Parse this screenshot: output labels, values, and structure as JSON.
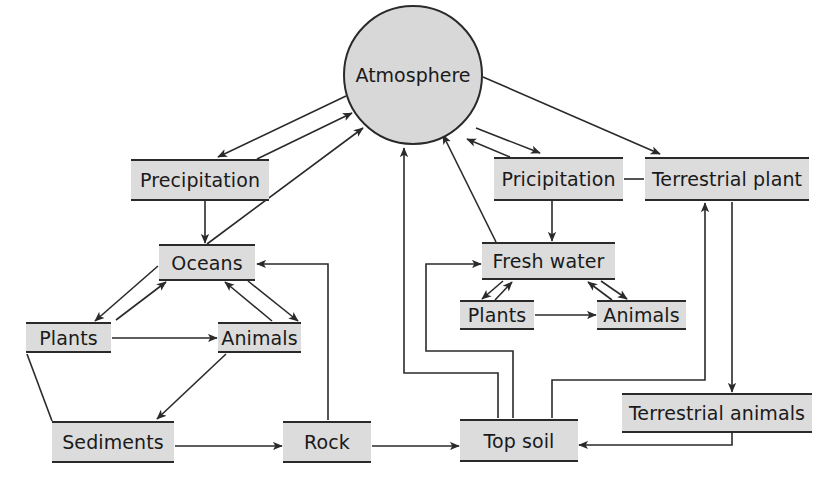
{
  "diagram": {
    "type": "cycle-flow-diagram",
    "colors": {
      "node_fill": "#dcdcdc",
      "circle_fill": "#d8d8d8",
      "line": "#2a2a2a",
      "background": "#ffffff"
    },
    "nodes": {
      "atmosphere": {
        "label": "Atmosphere",
        "shape": "circle",
        "cx": 413,
        "cy": 75,
        "r": 70
      },
      "precipitation_left": {
        "label": "Precipitation",
        "x": 131,
        "y": 159,
        "w": 138,
        "h": 42
      },
      "oceans": {
        "label": "Oceans",
        "x": 159,
        "y": 244,
        "w": 96,
        "h": 37
      },
      "plants_left": {
        "label": "Plants",
        "x": 26,
        "y": 322,
        "w": 85,
        "h": 31
      },
      "animals_left": {
        "label": "Animals",
        "x": 218,
        "y": 322,
        "w": 83,
        "h": 31
      },
      "sediments": {
        "label": "Sediments",
        "x": 52,
        "y": 421,
        "w": 122,
        "h": 42
      },
      "rock": {
        "label": "Rock",
        "x": 283,
        "y": 421,
        "w": 88,
        "h": 42
      },
      "top_soil": {
        "label": "Top soil",
        "x": 460,
        "y": 419,
        "w": 118,
        "h": 43
      },
      "precipitation_right": {
        "label": "Pricipitation",
        "x": 494,
        "y": 157,
        "w": 129,
        "h": 44
      },
      "terrestrial_plant": {
        "label": "Terrestrial plant",
        "x": 645,
        "y": 157,
        "w": 164,
        "h": 44
      },
      "fresh_water": {
        "label": "Fresh water",
        "x": 482,
        "y": 242,
        "w": 133,
        "h": 38
      },
      "plants_right": {
        "label": "Plants",
        "x": 460,
        "y": 300,
        "w": 74,
        "h": 30
      },
      "animals_right": {
        "label": "Animals",
        "x": 597,
        "y": 300,
        "w": 89,
        "h": 30
      },
      "terrestrial_animals": {
        "label": "Terrestrial animals",
        "x": 622,
        "y": 393,
        "w": 190,
        "h": 40
      }
    },
    "edges": [
      {
        "from": "atmosphere",
        "to": "precipitation_left",
        "points": [
          [
            346,
            96
          ],
          [
            218,
            157
          ]
        ],
        "arrow": "end"
      },
      {
        "from": "precipitation_left",
        "to": "atmosphere",
        "points": [
          [
            257,
            159
          ],
          [
            352,
            113
          ]
        ],
        "arrow": "end"
      },
      {
        "from": "precipitation_left",
        "to": "oceans",
        "points": [
          [
            205,
            201
          ],
          [
            205,
            243
          ]
        ],
        "arrow": "end"
      },
      {
        "from": "oceans",
        "to": "atmosphere",
        "points": [
          [
            207,
            244
          ],
          [
            363,
            128
          ]
        ],
        "arrow": "end"
      },
      {
        "from": "oceans",
        "to": "plants_left",
        "points": [
          [
            158,
            266
          ],
          [
            95,
            321
          ]
        ],
        "arrow": "end"
      },
      {
        "from": "plants_left",
        "to": "oceans",
        "points": [
          [
            116,
            320
          ],
          [
            166,
            282
          ]
        ],
        "arrow": "end"
      },
      {
        "from": "oceans",
        "to": "animals_left",
        "points": [
          [
            248,
            281
          ],
          [
            298,
            321
          ]
        ],
        "arrow": "end"
      },
      {
        "from": "animals_left",
        "to": "oceans",
        "points": [
          [
            272,
            321
          ],
          [
            225,
            282
          ]
        ],
        "arrow": "end"
      },
      {
        "from": "plants_left",
        "to": "animals_left",
        "points": [
          [
            112,
            338
          ],
          [
            217,
            338
          ]
        ],
        "arrow": "end"
      },
      {
        "from": "plants_left",
        "to": "sediments",
        "points": [
          [
            27,
            354
          ],
          [
            52,
            421
          ]
        ],
        "arrow": "none"
      },
      {
        "from": "animals_left",
        "to": "sediments",
        "points": [
          [
            226,
            354
          ],
          [
            157,
            419
          ]
        ],
        "arrow": "end"
      },
      {
        "from": "sediments",
        "to": "rock",
        "points": [
          [
            175,
            446
          ],
          [
            282,
            446
          ]
        ],
        "arrow": "end"
      },
      {
        "from": "rock",
        "to": "top_soil",
        "points": [
          [
            372,
            446
          ],
          [
            459,
            446
          ]
        ],
        "arrow": "end"
      },
      {
        "from": "rock",
        "to": "oceans",
        "points": [
          [
            328,
            420
          ],
          [
            328,
            264
          ],
          [
            257,
            264
          ]
        ],
        "arrow": "end"
      },
      {
        "from": "top_soil",
        "to": "atmosphere",
        "points": [
          [
            498,
            418
          ],
          [
            498,
            373
          ],
          [
            404,
            373
          ],
          [
            404,
            148
          ]
        ],
        "arrow": "end"
      },
      {
        "from": "top_soil",
        "to": "fresh_water",
        "points": [
          [
            513,
            418
          ],
          [
            513,
            351
          ],
          [
            426,
            351
          ],
          [
            426,
            264
          ],
          [
            481,
            264
          ]
        ],
        "arrow": "end"
      },
      {
        "from": "top_soil",
        "to": "terrestrial_plant",
        "points": [
          [
            552,
            418
          ],
          [
            552,
            380
          ],
          [
            705,
            380
          ],
          [
            705,
            203
          ]
        ],
        "arrow": "end"
      },
      {
        "from": "fresh_water",
        "to": "atmosphere",
        "points": [
          [
            496,
            242
          ],
          [
            443,
            135
          ]
        ],
        "arrow": "end"
      },
      {
        "from": "atmosphere",
        "to": "precipitation_right",
        "points": [
          [
            476,
            128
          ],
          [
            540,
            153
          ]
        ],
        "arrow": "end"
      },
      {
        "from": "precipitation_right",
        "to": "atmosphere",
        "points": [
          [
            510,
            157
          ],
          [
            467,
            139
          ]
        ],
        "arrow": "end"
      },
      {
        "from": "atmosphere",
        "to": "terrestrial_plant",
        "points": [
          [
            483,
            77
          ],
          [
            660,
            154
          ]
        ],
        "arrow": "end"
      },
      {
        "from": "precipitation_right",
        "to": "terrestrial_plant",
        "points": [
          [
            624,
            179
          ],
          [
            644,
            179
          ]
        ],
        "arrow": "none"
      },
      {
        "from": "precipitation_right",
        "to": "fresh_water",
        "points": [
          [
            552,
            201
          ],
          [
            552,
            241
          ]
        ],
        "arrow": "end"
      },
      {
        "from": "fresh_water",
        "to": "plants_right",
        "points": [
          [
            503,
            281
          ],
          [
            482,
            299
          ]
        ],
        "arrow": "end"
      },
      {
        "from": "plants_right",
        "to": "fresh_water",
        "points": [
          [
            495,
            300
          ],
          [
            512,
            282
          ]
        ],
        "arrow": "end"
      },
      {
        "from": "fresh_water",
        "to": "animals_right",
        "points": [
          [
            601,
            281
          ],
          [
            627,
            299
          ]
        ],
        "arrow": "end"
      },
      {
        "from": "animals_right",
        "to": "fresh_water",
        "points": [
          [
            612,
            300
          ],
          [
            588,
            282
          ]
        ],
        "arrow": "end"
      },
      {
        "from": "plants_right",
        "to": "animals_right",
        "points": [
          [
            535,
            315
          ],
          [
            596,
            315
          ]
        ],
        "arrow": "end"
      },
      {
        "from": "terrestrial_plant",
        "to": "terrestrial_animals",
        "points": [
          [
            732,
            202
          ],
          [
            732,
            392
          ]
        ],
        "arrow": "end"
      },
      {
        "from": "terrestrial_animals",
        "to": "top_soil",
        "points": [
          [
            732,
            433
          ],
          [
            732,
            445
          ],
          [
            579,
            445
          ]
        ],
        "arrow": "end"
      }
    ]
  }
}
